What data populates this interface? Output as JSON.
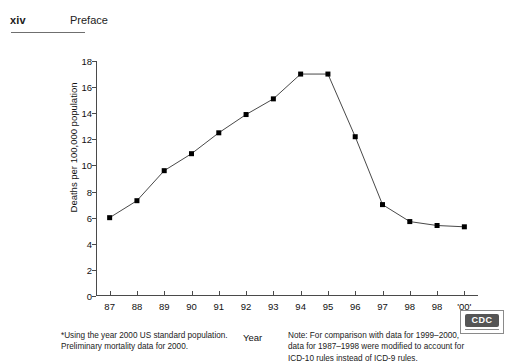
{
  "header": {
    "folio": "xiv",
    "running_head": "Preface"
  },
  "figure": {
    "x_axis_title": "Year",
    "note_left": [
      "*Using the year 2000 US standard population.",
      "Preliminary mortality data for 2000."
    ],
    "note_right": [
      "Note: For comparison with data for 1999–2000,",
      "data for 1987–1998 were modified to account for",
      "ICD-10 rules instead of ICD-9 rules."
    ]
  },
  "logo": {
    "text": "CDC"
  },
  "chart_data": {
    "type": "line",
    "title": "",
    "xlabel": "Year",
    "ylabel": "Deaths per 100,000 population",
    "categories": [
      "87",
      "88",
      "89",
      "90",
      "91",
      "92",
      "93",
      "94",
      "95",
      "96",
      "97",
      "98",
      "98",
      "'00'"
    ],
    "values": [
      6.0,
      7.3,
      9.6,
      10.9,
      12.5,
      13.9,
      15.1,
      17.0,
      17.0,
      12.2,
      7.0,
      5.7,
      5.4,
      5.3
    ],
    "ylim": [
      0,
      18
    ],
    "yticks": [
      0,
      2,
      4,
      6,
      8,
      10,
      12,
      14,
      16,
      18
    ],
    "grid": false,
    "legend": "none",
    "marker": "square",
    "line_color": "#333333",
    "marker_color": "#000000"
  }
}
